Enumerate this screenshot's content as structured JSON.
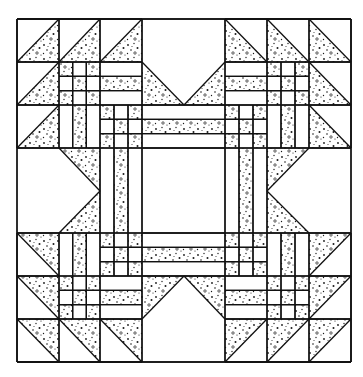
{
  "colors": {
    "line": "#111111",
    "fabric_light": "#ffffff",
    "speckle": "#1a1a1a"
  },
  "grid": {
    "cols": 8,
    "rows": 8,
    "x": [
      17,
      59,
      100,
      142,
      184,
      225,
      267,
      309,
      351
    ],
    "y": [
      19,
      62,
      105,
      148,
      191,
      233,
      276,
      319,
      362
    ]
  },
  "legend": {
    "speckled": "print fabric",
    "plain": "background fabric"
  },
  "block": {
    "center": "plain square (2×2 cells)",
    "inner_border": "strips: plain / print / plain",
    "corners": "nine-patch (print at corners and center)",
    "points": "half-square triangles (flying geese)",
    "side_notches": "plain pentagon with print V"
  }
}
